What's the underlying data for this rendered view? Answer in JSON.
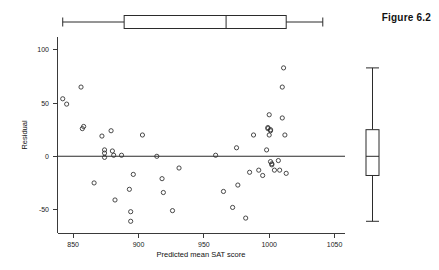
{
  "figure": {
    "caption": "Figure 6.2"
  },
  "chart_data": {
    "type": "scatter",
    "title": "",
    "xlabel": "Predicted mean SAT score",
    "ylabel": "Residual",
    "xlim": [
      838,
      1058
    ],
    "ylim": [
      -72,
      112
    ],
    "xticks": [
      850,
      900,
      950,
      1000,
      1050
    ],
    "xticklabels": [
      "850",
      "900",
      "950",
      "1000",
      "1050"
    ],
    "yticks": [
      -50,
      0,
      50,
      100
    ],
    "yticklabels": [
      "-50",
      "50",
      "0",
      "100"
    ],
    "ytick_values": [
      100,
      50,
      0,
      -50
    ],
    "ytick_text": [
      "100",
      "50",
      "0",
      "-50"
    ],
    "grid": false,
    "legend": null,
    "reference_line": {
      "orientation": "horizontal",
      "y": 0
    },
    "points": [
      [
        842,
        54
      ],
      [
        845,
        49
      ],
      [
        856,
        65
      ],
      [
        857,
        26
      ],
      [
        858,
        28
      ],
      [
        866,
        -25
      ],
      [
        872,
        19
      ],
      [
        874,
        6
      ],
      [
        874,
        3
      ],
      [
        874,
        -1
      ],
      [
        879,
        24
      ],
      [
        880,
        5
      ],
      [
        881,
        1
      ],
      [
        882,
        -41
      ],
      [
        887,
        1
      ],
      [
        893,
        -31
      ],
      [
        894,
        -52
      ],
      [
        894,
        -61
      ],
      [
        896,
        -17
      ],
      [
        903,
        20
      ],
      [
        914,
        0
      ],
      [
        918,
        -21
      ],
      [
        919,
        -34
      ],
      [
        926,
        -51
      ],
      [
        931,
        -11
      ],
      [
        959,
        1
      ],
      [
        965,
        -33
      ],
      [
        972,
        -48
      ],
      [
        975,
        8
      ],
      [
        976,
        -27
      ],
      [
        982,
        -58
      ],
      [
        985,
        -15
      ],
      [
        988,
        20
      ],
      [
        992,
        -13
      ],
      [
        995,
        -18
      ],
      [
        998,
        6
      ],
      [
        999,
        27
      ],
      [
        999,
        26
      ],
      [
        1000,
        39
      ],
      [
        1000,
        20
      ],
      [
        1001,
        25
      ],
      [
        1001,
        24
      ],
      [
        1001,
        -5
      ],
      [
        1002,
        -7
      ],
      [
        1002,
        -8
      ],
      [
        1004,
        -13
      ],
      [
        1007,
        -4
      ],
      [
        1008,
        -13
      ],
      [
        1010,
        65
      ],
      [
        1010,
        36
      ],
      [
        1011,
        83
      ],
      [
        1012,
        20
      ],
      [
        1013,
        -16
      ]
    ],
    "x_boxplot": {
      "orientation": "horizontal",
      "min": 842,
      "q1": 889,
      "median": 967,
      "q3": 1013,
      "max": 1041,
      "position_note": "above plot"
    },
    "y_boxplot": {
      "orientation": "vertical",
      "min": -61,
      "q1": -18,
      "median": 0,
      "q3": 25,
      "max": 83,
      "position_note": "right of plot"
    }
  }
}
